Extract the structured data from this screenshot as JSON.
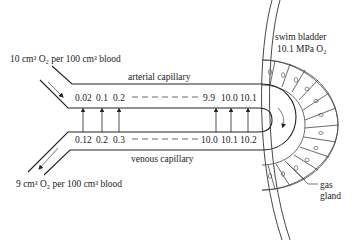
{
  "diagram": {
    "labels": {
      "inflow": "10 cm³ O₂ per 100 cm³ blood",
      "outflow": "9 cm³ O₂ per 100 cm³ blood",
      "arterial": "arterial capillary",
      "venous": "venous capillary",
      "swim_bladder": "swim bladder",
      "swim_bladder_pressure": "10.1 MPa O₂",
      "gas_gland_line1": "gas",
      "gas_gland_line2": "gland"
    },
    "arterial_values": [
      "0.02",
      "0.1",
      "0.2",
      "9.9",
      "10.0",
      "10.1"
    ],
    "venous_values": [
      "0.12",
      "0.2",
      "0.3",
      "10.0",
      "10.1",
      "10.2"
    ],
    "diffusion_arrows": "venous → arterial",
    "colors": {
      "line": "#222222",
      "background": "#ffffff"
    }
  }
}
